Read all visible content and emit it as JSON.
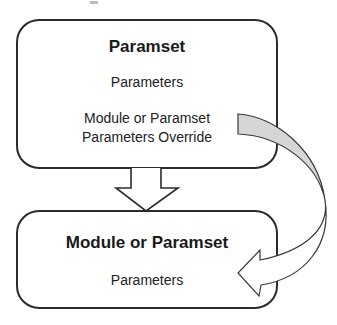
{
  "diagram": {
    "colors": {
      "border": "#2b2b2b",
      "band_fill": "#d6d6d6",
      "background": "#ffffff",
      "text": "#1a1a1a"
    },
    "top_box": {
      "title": "Paramset",
      "line1": "Parameters",
      "line2": "Module or Paramset",
      "line3": "Parameters Override"
    },
    "bottom_box": {
      "title": "Module or Paramset",
      "line1": "Parameters"
    },
    "connectors": [
      {
        "type": "hollow-down-arrow",
        "from": "top_box",
        "to": "bottom_box"
      },
      {
        "type": "curved-twisted-arrow",
        "from": "top_box.line3",
        "to": "bottom_box.line1"
      }
    ]
  }
}
